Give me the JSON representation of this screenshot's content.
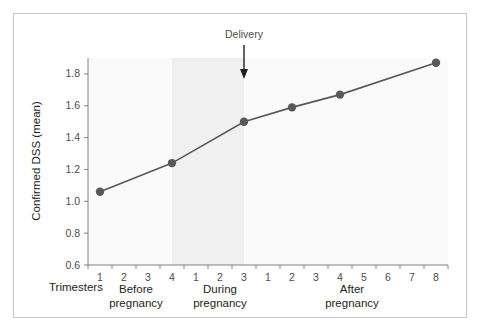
{
  "figure": {
    "background_color": "#ffffff",
    "frame_border_color": "#c8c8c8"
  },
  "chart_data": {
    "type": "line",
    "title": "",
    "xlabel": "",
    "ylabel": "Confirmed DSS (mean)",
    "ylim": [
      0.6,
      1.9
    ],
    "yticks": [
      "0.6",
      "0.8",
      "1.0",
      "1.2",
      "1.4",
      "1.6",
      "1.8"
    ],
    "ytick_values": [
      0.6,
      0.8,
      1.0,
      1.2,
      1.4,
      1.6,
      1.8
    ],
    "grid": false,
    "legend": "none",
    "x_axis_group_label": "Trimesters",
    "x_groups": [
      {
        "name": "Before pregnancy",
        "label_line1": "Before",
        "label_line2": "pregnancy",
        "ticks": [
          "1",
          "2",
          "3",
          "4"
        ]
      },
      {
        "name": "During pregnancy",
        "label_line1": "During",
        "label_line2": "pregnancy",
        "ticks": [
          "1",
          "2",
          "3"
        ]
      },
      {
        "name": "After pregnancy",
        "label_line1": "After",
        "label_line2": "pregnancy",
        "ticks": [
          "1",
          "2",
          "3",
          "4",
          "5",
          "6",
          "7",
          "8"
        ]
      }
    ],
    "x_tick_labels": [
      "1",
      "2",
      "3",
      "4",
      "1",
      "2",
      "3",
      "1",
      "2",
      "3",
      "4",
      "5",
      "6",
      "7",
      "8"
    ],
    "series": [
      {
        "name": "Confirmed DSS (mean)",
        "color": "#595959",
        "marker": "circle",
        "points": [
          {
            "x_index": 0,
            "x_group": "Before pregnancy",
            "x_tick": "1",
            "y": 1.06
          },
          {
            "x_index": 3,
            "x_group": "Before pregnancy",
            "x_tick": "4",
            "y": 1.24
          },
          {
            "x_index": 6,
            "x_group": "During pregnancy",
            "x_tick": "3",
            "y": 1.5
          },
          {
            "x_index": 8,
            "x_group": "After pregnancy",
            "x_tick": "2",
            "y": 1.59
          },
          {
            "x_index": 10,
            "x_group": "After pregnancy",
            "x_tick": "4",
            "y": 1.67
          },
          {
            "x_index": 14,
            "x_group": "After pregnancy",
            "x_tick": "8",
            "y": 1.87
          }
        ]
      }
    ],
    "shaded_band": {
      "label": "During pregnancy",
      "color": "#f0f0f0",
      "from_x_index": 3.5,
      "to_x_index": 6.5
    },
    "plot_background_color": "#fafafa",
    "annotations": [
      {
        "text": "Delivery",
        "type": "arrow-down",
        "x_index": 6.5,
        "color": "#4d4d4d"
      }
    ]
  }
}
